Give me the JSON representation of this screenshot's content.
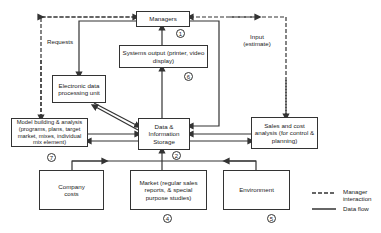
{
  "diagram": {
    "nodes": {
      "managers": {
        "label": "Managers",
        "number": "1"
      },
      "systems_output": {
        "label": "Systems output (printer, video display)",
        "number": "6"
      },
      "edp_unit": {
        "label": "Electronic data processing unit"
      },
      "model_building": {
        "label": "Model building & analysis (programs, plans, target market, mixes, individual mix element)",
        "number": "7"
      },
      "data_storage": {
        "label": "Data & Information Storage",
        "number": "2"
      },
      "sales_cost": {
        "label": "Sales and cost analysis (for control & planning)"
      },
      "company_costs": {
        "label": "Company costs"
      },
      "market": {
        "label": "Market (regular sales reports, & special purpose studies)",
        "number": "4"
      },
      "environment": {
        "label": "Environment",
        "number": "5"
      }
    },
    "edge_labels": {
      "requests": "Requests",
      "input_estimate": "Input (estimate)"
    },
    "legend": {
      "manager_interaction": "Manager interaction",
      "data_flow": "Data flow"
    },
    "colors": {
      "line": "#333333",
      "background": "#ffffff"
    }
  }
}
